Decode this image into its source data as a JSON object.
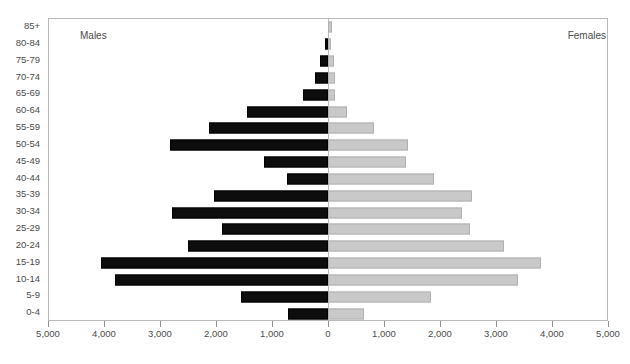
{
  "captions": {
    "males": "Males",
    "females": "Females"
  },
  "chart_data": {
    "type": "bar",
    "subtype": "population-pyramid",
    "title": "",
    "xlabel": "",
    "ylabel": "",
    "orientation": "horizontal",
    "grid": false,
    "legend_position": "inside-top-corners",
    "legend_entries": [
      "Males",
      "Females"
    ],
    "axis_center_value": 0,
    "xlim_left": [
      5000,
      0
    ],
    "xlim_right": [
      0,
      5000
    ],
    "x_tick_interval": 1000,
    "x_tick_labels_left": [
      "5,000",
      "4,000",
      "3,000",
      "2,000",
      "1,000"
    ],
    "x_tick_label_center": "0",
    "x_tick_labels_right": [
      "1,000",
      "2,000",
      "3,000",
      "4,000",
      "5,000"
    ],
    "x_tick_labels_all": [
      "5,000",
      "4,000",
      "3,000",
      "2,000",
      "1,000",
      "0",
      "1,000",
      "2,000",
      "3,000",
      "4,000",
      "5,000"
    ],
    "categories": [
      "85+",
      "80-84",
      "75-79",
      "70-74",
      "65-69",
      "60-64",
      "55-59",
      "50-54",
      "45-49",
      "40-44",
      "35-39",
      "30-34",
      "25-29",
      "20-24",
      "15-19",
      "10-14",
      "5-9",
      "0-4"
    ],
    "series": [
      {
        "name": "Males",
        "direction": "left",
        "color": "#0d0d0d",
        "values": [
          0,
          60,
          150,
          230,
          440,
          1450,
          2130,
          2830,
          1140,
          740,
          2030,
          2790,
          1900,
          2500,
          4060,
          3800,
          1560,
          710
        ]
      },
      {
        "name": "Females",
        "direction": "right",
        "color": "#c9c9c9",
        "values": [
          70,
          60,
          110,
          120,
          130,
          345,
          830,
          1430,
          1390,
          1900,
          2570,
          2390,
          2530,
          3150,
          3800,
          3400,
          1840,
          650
        ]
      }
    ]
  }
}
